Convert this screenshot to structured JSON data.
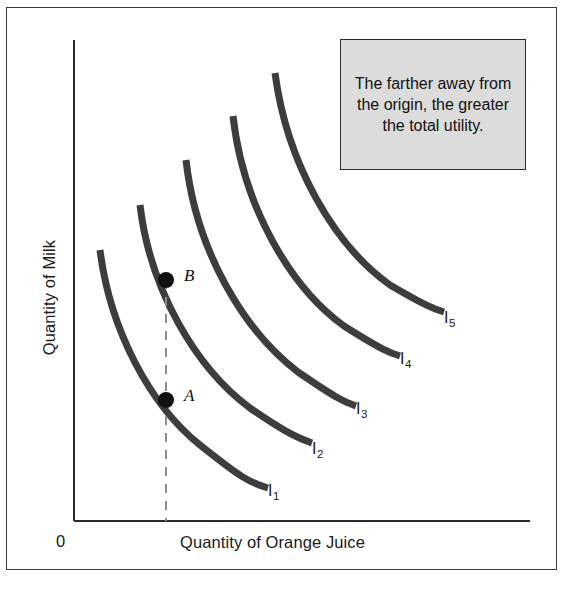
{
  "chart_data": {
    "type": "line",
    "title": "",
    "subtitle": "",
    "xlabel": "Quantity of Orange Juice",
    "ylabel": "Quantity of Milk",
    "origin_label": "0",
    "grid": false,
    "legend_position": "inline-right-of-curve-ends",
    "axis_ranges": {
      "x": [
        0,
        1
      ],
      "y": [
        0,
        1
      ]
    },
    "annotation": "The farther away from the origin, the greater the total utility.",
    "series": [
      {
        "name": "I1",
        "label": "I",
        "subscript": "1",
        "label_x": 268,
        "label_y": 482,
        "path": "M 100,250 C 110,330 150,405 200,445 C 240,477 250,483 268,488"
      },
      {
        "name": "I2",
        "label": "I",
        "subscript": "2",
        "label_x": 312,
        "label_y": 440,
        "path": "M 140,205 C 150,290 196,368 250,408 C 288,434 298,438 312,443"
      },
      {
        "name": "I3",
        "label": "I",
        "subscript": "3",
        "label_x": 356,
        "label_y": 400,
        "path": "M 186,160 C 196,250 243,330 298,372 C 336,398 344,402 356,406"
      },
      {
        "name": "I4",
        "label": "I",
        "subscript": "4",
        "label_x": 400,
        "label_y": 350,
        "path": "M 233,116 C 243,206 290,287 344,326 C 382,350 390,353 400,356"
      },
      {
        "name": "I5",
        "label": "I",
        "subscript": "5",
        "label_x": 444,
        "label_y": 309,
        "path": "M 275,73 C 287,164 334,245 390,285 C 424,305 434,309 444,312"
      }
    ],
    "points": [
      {
        "name": "B",
        "label": "B",
        "x": 166,
        "y": 280,
        "label_x": 184,
        "label_y": 266,
        "on_curve": "I2"
      },
      {
        "name": "A",
        "label": "A",
        "x": 166,
        "y": 400,
        "label_x": 184,
        "label_y": 386,
        "on_curve": "I1"
      }
    ],
    "reference_line": {
      "name": "vertical-dashed-guide",
      "x": 166,
      "y_top": 280,
      "y_bottom": 521,
      "style": "dashed",
      "color": "#8c8c8c"
    },
    "axes": {
      "y_axis": {
        "x": 74,
        "y_top": 40,
        "y_bottom": 521
      },
      "x_axis": {
        "y": 521,
        "x_left": 74,
        "x_right": 530
      }
    },
    "colors": {
      "curve": "#3d3d3d",
      "axis": "#2b2b2b",
      "point": "#111111",
      "callout_fill": "#dcdcdc",
      "callout_border": "#2b2b2b",
      "frame": "#3a3a3a",
      "text": "#1a1a1a"
    }
  },
  "callout": {
    "text": "The farther away from the origin, the greater the total utility."
  }
}
